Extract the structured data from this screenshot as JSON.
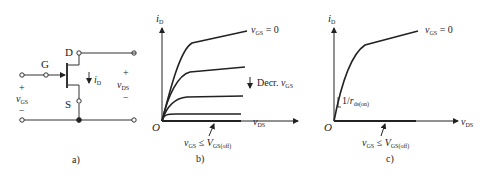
{
  "panel_a": {
    "caption": "a)",
    "labels": {
      "gate": "G",
      "drain": "D",
      "source": "S",
      "current": "i",
      "current_sub": "D",
      "vgs": "v",
      "vgs_sub": "GS",
      "vds": "v",
      "vds_sub": "DS",
      "plus": "+",
      "minus": "−"
    }
  },
  "panel_b": {
    "caption": "b)",
    "y_axis": "i",
    "y_sub": "D",
    "x_axis": "v",
    "x_sub": "DS",
    "origin": "O",
    "top_label": "v",
    "top_label_sub": "GS",
    "top_label_val": " = 0",
    "decr_label": "Decr. ",
    "decr_v": "v",
    "decr_sub": "GS",
    "cutoff_v": "v",
    "cutoff_sub": "GS",
    "cutoff_le": " ≤ ",
    "cutoff_V": "V",
    "cutoff_Vsub": "GS(off)"
  },
  "panel_c": {
    "caption": "c)",
    "y_axis": "i",
    "y_sub": "D",
    "x_axis": "v",
    "x_sub": "DS",
    "origin": "O",
    "top_label": "v",
    "top_label_sub": "GS",
    "top_label_val": " = 0",
    "slope_label": "1/",
    "slope_r": "r",
    "slope_sub": "ds(on)",
    "cutoff_v": "v",
    "cutoff_sub": "GS",
    "cutoff_le": " ≤ ",
    "cutoff_V": "V",
    "cutoff_Vsub": "GS(off)"
  }
}
